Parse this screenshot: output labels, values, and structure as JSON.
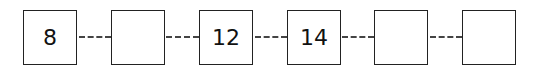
{
  "sequence": {
    "boxes": [
      {
        "value": "8"
      },
      {
        "value": ""
      },
      {
        "value": "12"
      },
      {
        "value": "14"
      },
      {
        "value": ""
      },
      {
        "value": ""
      }
    ]
  }
}
